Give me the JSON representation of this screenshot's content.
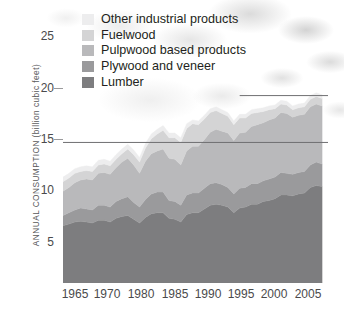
{
  "chart_data": {
    "type": "area",
    "stacked": true,
    "title": "",
    "subtitle": "",
    "xlabel": "",
    "ylabel": "ANNUAL CONSUMPTION (billion cubic feet)",
    "xlim": [
      1962,
      2007
    ],
    "ylim": [
      0,
      27
    ],
    "yticks": [
      5,
      10,
      15,
      20,
      25
    ],
    "ytick_labels": [
      "5",
      "10",
      "15",
      "20",
      "25"
    ],
    "xticks": [
      1965,
      1970,
      1980,
      1985,
      1990,
      1995,
      2000,
      2005
    ],
    "xtick_labels": [
      "1965",
      "1970",
      "1980",
      "1985",
      "1990",
      "1995",
      "2000",
      "2005"
    ],
    "gridlines": [
      "15",
      "20"
    ],
    "grid": true,
    "legend_position": "top-left",
    "x": [
      1962,
      1963,
      1964,
      1965,
      1966,
      1967,
      1968,
      1969,
      1970,
      1971,
      1972,
      1973,
      1974,
      1975,
      1976,
      1977,
      1978,
      1979,
      1980,
      1981,
      1982,
      1983,
      1984,
      1985,
      1986,
      1987,
      1988,
      1989,
      1990,
      1991,
      1992,
      1993,
      1994,
      1995,
      1996,
      1997,
      1998,
      1999,
      2000,
      2001,
      2002,
      2003,
      2004,
      2005,
      2006
    ],
    "series": [
      {
        "name": "Lumber",
        "color": "#7d7d7f",
        "values": [
          6.1,
          6.3,
          6.5,
          6.6,
          6.5,
          6.4,
          6.7,
          6.7,
          6.5,
          6.9,
          7.1,
          7.2,
          6.8,
          6.4,
          7.0,
          7.4,
          7.5,
          7.5,
          6.9,
          6.8,
          6.5,
          7.3,
          7.5,
          7.5,
          7.9,
          8.3,
          8.4,
          8.3,
          8.1,
          7.5,
          8.0,
          8.1,
          8.4,
          8.4,
          8.7,
          8.8,
          9.0,
          9.4,
          9.4,
          9.3,
          9.5,
          9.6,
          10.2,
          10.4,
          10.3
        ]
      },
      {
        "name": "Plywood and veneer",
        "color": "#9a9a9c",
        "values": [
          1.1,
          1.2,
          1.3,
          1.4,
          1.4,
          1.4,
          1.6,
          1.6,
          1.6,
          1.8,
          1.9,
          2.0,
          1.8,
          1.7,
          1.9,
          2.1,
          2.2,
          2.2,
          1.9,
          1.9,
          1.8,
          2.1,
          2.1,
          2.1,
          2.2,
          2.3,
          2.3,
          2.2,
          2.1,
          2.0,
          2.1,
          2.1,
          2.2,
          2.2,
          2.2,
          2.3,
          2.3,
          2.4,
          2.3,
          2.3,
          2.3,
          2.3,
          2.4,
          2.5,
          2.4
        ]
      },
      {
        "name": "Pulpwood based products",
        "color": "#b9b9bb",
        "values": [
          2.6,
          2.7,
          2.9,
          3.0,
          3.2,
          3.2,
          3.4,
          3.5,
          3.5,
          3.6,
          3.9,
          4.1,
          4.0,
          3.6,
          4.1,
          4.3,
          4.4,
          4.6,
          4.5,
          4.5,
          4.3,
          4.7,
          5.0,
          5.0,
          5.2,
          5.5,
          5.7,
          5.7,
          5.8,
          5.7,
          5.9,
          5.9,
          6.1,
          6.3,
          6.2,
          6.3,
          6.3,
          6.4,
          6.4,
          6.1,
          6.1,
          6.1,
          6.2,
          6.2,
          6.2
        ]
      },
      {
        "name": "Fuelwood",
        "color": "#d4d4d5",
        "values": [
          1.0,
          1.0,
          1.0,
          0.9,
          0.9,
          0.9,
          0.9,
          0.9,
          0.9,
          0.9,
          0.9,
          1.0,
          1.1,
          1.2,
          1.4,
          1.6,
          1.8,
          2.0,
          2.2,
          2.3,
          2.4,
          2.4,
          2.4,
          2.3,
          2.2,
          2.1,
          2.0,
          1.9,
          1.8,
          1.7,
          1.6,
          1.5,
          1.4,
          1.3,
          1.2,
          1.1,
          1.0,
          0.9,
          0.9,
          0.8,
          0.8,
          0.8,
          0.8,
          0.8,
          0.8
        ]
      },
      {
        "name": "Other industrial products",
        "color": "#ededee",
        "values": [
          0.5,
          0.5,
          0.5,
          0.5,
          0.5,
          0.5,
          0.5,
          0.5,
          0.5,
          0.5,
          0.5,
          0.5,
          0.5,
          0.5,
          0.5,
          0.5,
          0.5,
          0.5,
          0.5,
          0.5,
          0.5,
          0.5,
          0.4,
          0.4,
          0.4,
          0.4,
          0.4,
          0.4,
          0.4,
          0.4,
          0.4,
          0.4,
          0.4,
          0.4,
          0.4,
          0.4,
          0.4,
          0.4,
          0.4,
          0.4,
          0.4,
          0.4,
          0.4,
          0.4,
          0.4
        ]
      }
    ]
  },
  "legend": {
    "items": [
      {
        "label": "Other industrial products",
        "color": "#ededee"
      },
      {
        "label": "Fuelwood",
        "color": "#d4d4d5"
      },
      {
        "label": "Pulpwood based products",
        "color": "#b9b9bb"
      },
      {
        "label": "Plywood and veneer",
        "color": "#9a9a9c"
      },
      {
        "label": "Lumber",
        "color": "#7d7d7f"
      }
    ]
  },
  "axes": {
    "y_title": "ANNUAL CONSUMPTION (billion cubic feet)",
    "y_labels": [
      "25",
      "20",
      "15",
      "10",
      "5"
    ],
    "x_labels": [
      "1965",
      "1970",
      "1980",
      "1985",
      "1990",
      "1995",
      "2000",
      "2005"
    ]
  }
}
